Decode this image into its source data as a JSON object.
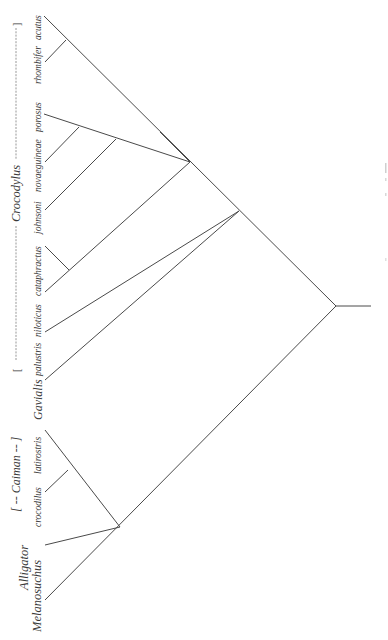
{
  "diagram": {
    "type": "cladogram",
    "orientation": "rotated-90-ccw",
    "line_color": "#4a4a4a",
    "text_color": "#3a3a3a",
    "groups": [
      {
        "id": "crocodylus",
        "label": "Crocodylus",
        "bracket_open": "[",
        "bracket_close": "]"
      },
      {
        "id": "caiman",
        "label": "Caiman",
        "bracket_text": "[ -- Caiman -- ]"
      }
    ],
    "labels": {
      "acutus": "acutus",
      "rhombifer": "rhombifer",
      "porosus": "porosus",
      "novaeguineae": "novaeguineae",
      "johnsoni": "johnsoni",
      "cataphractus": "cataphractus",
      "niloticus": "niloticus",
      "palustris": "palustris",
      "gavialis": "Gavialis",
      "latirostris": "latirostris",
      "crocodilus": "crocodilus",
      "alligator": "Alligator",
      "melanosuchus": "Melanosuchus",
      "crocodylus_genus": "Crocodylus",
      "caiman_genus": "[ -- Caiman -- ]",
      "croc_bracket_open": "[",
      "croc_bracket_close": "]",
      "croc_dash_left": "------------------------------",
      "croc_dash_right": "--------------------"
    },
    "tips": [
      {
        "name": "acutus",
        "genus": "Crocodylus"
      },
      {
        "name": "rhombifer",
        "genus": "Crocodylus"
      },
      {
        "name": "porosus",
        "genus": "Crocodylus"
      },
      {
        "name": "novaeguineae",
        "genus": "Crocodylus"
      },
      {
        "name": "johnsoni",
        "genus": "Crocodylus"
      },
      {
        "name": "cataphractus",
        "genus": "Crocodylus"
      },
      {
        "name": "niloticus",
        "genus": "Crocodylus"
      },
      {
        "name": "palustris",
        "genus": "Crocodylus"
      },
      {
        "name": "Gavialis",
        "genus": "Gavialis"
      },
      {
        "name": "latirostris",
        "genus": "Caiman"
      },
      {
        "name": "crocodilus",
        "genus": "Caiman"
      },
      {
        "name": "Alligator",
        "genus": "Alligator"
      },
      {
        "name": "Melanosuchus",
        "genus": "Melanosuchus"
      }
    ],
    "topology": "((((acutus,rhombifer),((porosus,novaeguineae,johnsoni),(cataphractus,niloticus))),(palustris,Gavialis)),((latirostris,crocodilus),Alligator,Melanosuchus))"
  }
}
